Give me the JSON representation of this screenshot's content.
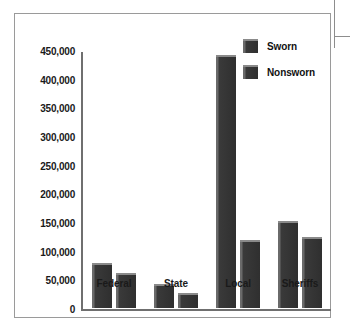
{
  "chart_data": {
    "type": "bar",
    "title": "",
    "subtitle": "",
    "xlabel": "",
    "ylabel": "",
    "categories": [
      "Federal",
      "State",
      "Local",
      "Sheriffs"
    ],
    "series": [
      {
        "name": "Sworn",
        "values": [
          78000,
          42000,
          441000,
          152000
        ]
      },
      {
        "name": "Nonsworn",
        "values": [
          61000,
          27000,
          119000,
          124000
        ]
      }
    ],
    "ylim": [
      0,
      450000
    ],
    "ytick_values": [
      0,
      50000,
      100000,
      150000,
      200000,
      250000,
      300000,
      350000,
      400000,
      450000
    ],
    "ytick_labels": [
      "0",
      "50,000",
      "100,000",
      "150,000",
      "200,000",
      "250,000",
      "300,000",
      "350,000",
      "400,000",
      "450,000"
    ],
    "grid": false,
    "legend_position": "top-right",
    "bar_color": "#2f2f2f",
    "bar_highlight_color": "#8a8a8a",
    "axis_color": "#6f6f6f",
    "frame_color": "#9a9a9a",
    "background": "#ffffff",
    "text_color": "#1a1a1a"
  },
  "legend": {
    "items": [
      {
        "label": "Sworn"
      },
      {
        "label": "Nonsworn"
      }
    ]
  },
  "axis": {
    "y_labels": [
      "450,000",
      "400,000",
      "350,000",
      "300,000",
      "250,000",
      "200,000",
      "150,000",
      "100,000",
      "50,000",
      "0"
    ],
    "x_labels": [
      "Federal",
      "State",
      "Local",
      "Sheriffs"
    ]
  }
}
